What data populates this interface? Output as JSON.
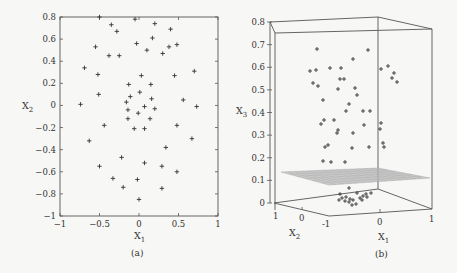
{
  "figure": {
    "panels": [
      {
        "id": "a",
        "caption": "(a)",
        "xlabel_main": "X",
        "xlabel_sub": "1",
        "ylabel_main": "X",
        "ylabel_sub": "2",
        "x_ticks": [
          "-1",
          "-0.5",
          "0",
          "0.5",
          "1"
        ],
        "y_ticks": [
          "0.8",
          "0.6",
          "0.4",
          "0.2",
          "0",
          "-0.2",
          "-0.4",
          "-0.6",
          "-0.8",
          "-1"
        ]
      },
      {
        "id": "b",
        "caption": "(b)",
        "x1label_main": "X",
        "x1label_sub": "1",
        "x2label_main": "X",
        "x2label_sub": "2",
        "x3label_main": "X",
        "x3label_sub": "3",
        "x1_ticks": [
          "-1",
          "0",
          "1"
        ],
        "x2_ticks": [
          "1",
          "0"
        ],
        "z_ticks": [
          "0.8",
          "0.7",
          "0.6",
          "0.5",
          "0.4",
          "0.3",
          "0.2",
          "0.1",
          "0"
        ]
      }
    ]
  },
  "chart_data": [
    {
      "type": "scatter",
      "title": "",
      "caption": "(a)",
      "xlabel": "X1",
      "ylabel": "X2",
      "xlim": [
        -1,
        1
      ],
      "ylim": [
        -1,
        0.8
      ],
      "grid": false,
      "marker": "+",
      "series": [
        {
          "name": "points",
          "x": [
            -0.5,
            -0.05,
            0.2,
            -0.35,
            -0.28,
            0.4,
            0.17,
            -0.55,
            -0.03,
            0.1,
            0.3,
            0.38,
            0.48,
            -0.38,
            -0.25,
            -0.69,
            0.7,
            -0.52,
            0.03,
            0.45,
            -0.13,
            0.15,
            0.01,
            -0.51,
            -0.11,
            0.16,
            0.56,
            -0.16,
            -0.74,
            0.73,
            -0.14,
            0.07,
            0.2,
            -0.01,
            -0.14,
            0.14,
            0.48,
            -0.44,
            -0.06,
            0.07,
            -0.63,
            0.34,
            0.67,
            -0.22,
            0.07,
            0.29,
            -0.5,
            0.48,
            -0.33,
            -0.02,
            -0.2,
            0.29,
            0.0
          ],
          "y": [
            0.8,
            0.78,
            0.74,
            0.73,
            0.67,
            0.69,
            0.61,
            0.53,
            0.56,
            0.5,
            0.47,
            0.53,
            0.55,
            0.45,
            0.45,
            0.34,
            0.31,
            0.28,
            0.27,
            0.27,
            0.19,
            0.19,
            0.12,
            0.1,
            0.08,
            0.06,
            0.05,
            0.03,
            0.01,
            -0.01,
            -0.04,
            -0.01,
            -0.03,
            -0.07,
            -0.12,
            -0.12,
            -0.18,
            -0.18,
            -0.21,
            -0.21,
            -0.32,
            -0.38,
            -0.3,
            -0.47,
            -0.52,
            -0.55,
            -0.55,
            -0.6,
            -0.66,
            -0.67,
            -0.74,
            -0.75,
            -0.85
          ]
        }
      ]
    },
    {
      "type": "scatter",
      "title": "",
      "caption": "(b)",
      "xlabel": "X1",
      "ylabel": "X2",
      "zlabel": "X3",
      "xlim": [
        -1,
        1
      ],
      "ylim": [
        -1,
        1
      ],
      "zlim": [
        0,
        0.8
      ],
      "grid": false,
      "marker": "+",
      "plane": {
        "z": 0.1,
        "style": "gray mesh"
      },
      "series": [
        {
          "name": "points_above_plane_projected_z",
          "z": [
            0.68,
            0.65,
            0.63,
            0.61,
            0.59,
            0.59,
            0.58,
            0.57,
            0.55,
            0.54,
            0.53,
            0.53,
            0.51,
            0.51,
            0.5,
            0.47,
            0.44,
            0.42,
            0.41,
            0.41,
            0.36,
            0.34,
            0.33,
            0.32,
            0.31,
            0.31,
            0.29,
            0.27,
            0.26,
            0.25,
            0.25,
            0.25,
            0.25,
            0.19
          ]
        },
        {
          "name": "points_below_plane_cluster_z",
          "z": [
            0.07,
            0.05,
            0.05,
            0.04,
            0.04,
            0.03,
            0.03,
            0.03,
            0.02,
            0.02,
            0.02,
            0.01,
            0.01,
            0.0,
            -0.01
          ]
        }
      ]
    }
  ]
}
